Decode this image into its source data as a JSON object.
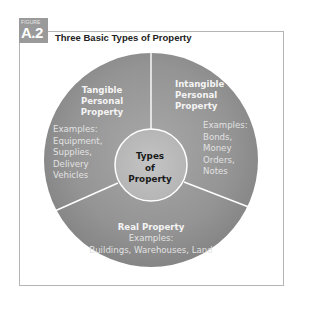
{
  "figure": {
    "badge_label": "FIGURE",
    "number": "A.2",
    "title": "Three Basic Types of Property"
  },
  "diagram": {
    "center": {
      "line1": "Types",
      "line2": "of",
      "line3": "Property"
    },
    "segments": [
      {
        "heading": [
          "Tangible",
          "Personal",
          "Property"
        ],
        "examples_label": "Examples:",
        "examples": [
          "Equipment,",
          "Supplies,",
          "Delivery",
          "Vehicles"
        ]
      },
      {
        "heading": [
          "Intangible",
          "Personal",
          "Property"
        ],
        "examples_label": "Examples:",
        "examples": [
          "Bonds,",
          "Money",
          "Orders,",
          "Notes"
        ]
      },
      {
        "heading": [
          "Real Property"
        ],
        "examples_label": "Examples:",
        "examples": [
          "Buildings, Warehouses, Land"
        ]
      }
    ],
    "colors": {
      "outer_ring": "#8f8f8f",
      "outer_ring_light": "#a5a5a5",
      "inner_circle": "#bdbdbd",
      "divider": "#ffffff",
      "badge": "#9a9a9a",
      "frame": "#b5b5b5"
    }
  }
}
